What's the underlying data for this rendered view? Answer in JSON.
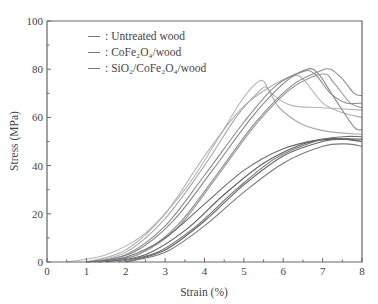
{
  "chart_data": {
    "type": "line",
    "title": "",
    "xlabel": "Strain (%)",
    "ylabel": "Stress (MPa)",
    "xlim": [
      0,
      8
    ],
    "ylim": [
      0,
      100
    ],
    "x_ticks": [
      "0",
      "1",
      "2",
      "3",
      "4",
      "5",
      "6",
      "7",
      "8"
    ],
    "y_ticks": [
      "0",
      "20",
      "40",
      "60",
      "80",
      "100"
    ],
    "grid": false,
    "legend_position": "upper-left",
    "legend": [
      {
        "name": "Untreated wood",
        "color": "#9a9a9a"
      },
      {
        "name": "CoFe2O4/wood",
        "color": "#777777"
      },
      {
        "name": "SiO2/CoFe2O4/wood",
        "color": "#555555"
      }
    ],
    "series": [
      {
        "name": "Untreated wood",
        "color": "#b5b5b5",
        "points": [
          [
            0.5,
            0
          ],
          [
            1.5,
            3
          ],
          [
            2.5,
            12
          ],
          [
            3.5,
            30
          ],
          [
            4.3,
            50
          ],
          [
            4.9,
            66
          ],
          [
            5.3,
            74
          ],
          [
            5.5,
            75
          ],
          [
            5.7,
            70
          ],
          [
            6.2,
            65
          ],
          [
            7,
            64
          ],
          [
            8,
            63
          ]
        ]
      },
      {
        "name": "Untreated wood",
        "color": "#aaaaaa",
        "points": [
          [
            1,
            0
          ],
          [
            2,
            4
          ],
          [
            3,
            18
          ],
          [
            4,
            40
          ],
          [
            4.8,
            60
          ],
          [
            5.4,
            71
          ],
          [
            5.6,
            72
          ],
          [
            5.9,
            64
          ],
          [
            6.5,
            57
          ],
          [
            7.2,
            54
          ],
          [
            8,
            53
          ]
        ]
      },
      {
        "name": "Untreated wood",
        "color": "#b0b0b0",
        "points": [
          [
            1,
            0
          ],
          [
            2,
            5
          ],
          [
            3,
            20
          ],
          [
            4,
            44
          ],
          [
            4.9,
            63
          ],
          [
            5.6,
            72
          ],
          [
            6.2,
            77
          ],
          [
            6.5,
            76
          ],
          [
            7,
            66
          ],
          [
            7.5,
            62
          ],
          [
            8,
            60
          ]
        ]
      },
      {
        "name": "CoFe2O4/wood",
        "color": "#8c8c8c",
        "points": [
          [
            1,
            0
          ],
          [
            2,
            3
          ],
          [
            3,
            15
          ],
          [
            4,
            36
          ],
          [
            5,
            58
          ],
          [
            5.8,
            73
          ],
          [
            6.5,
            79
          ],
          [
            6.8,
            78
          ],
          [
            7.2,
            70
          ],
          [
            7.6,
            66
          ],
          [
            8,
            66
          ]
        ]
      },
      {
        "name": "CoFe2O4/wood",
        "color": "#888888",
        "points": [
          [
            1.2,
            0
          ],
          [
            2.2,
            4
          ],
          [
            3.2,
            17
          ],
          [
            4.2,
            38
          ],
          [
            5.2,
            60
          ],
          [
            6,
            74
          ],
          [
            6.6,
            80
          ],
          [
            6.9,
            78
          ],
          [
            7.3,
            68
          ],
          [
            7.8,
            56
          ],
          [
            8,
            55
          ]
        ]
      },
      {
        "name": "CoFe2O4/wood",
        "color": "#909090",
        "points": [
          [
            1.3,
            0
          ],
          [
            2.3,
            3
          ],
          [
            3.3,
            15
          ],
          [
            4.3,
            36
          ],
          [
            5.3,
            58
          ],
          [
            6.2,
            73
          ],
          [
            6.9,
            79
          ],
          [
            7.2,
            80
          ],
          [
            7.5,
            76
          ],
          [
            7.8,
            70
          ],
          [
            8,
            69
          ]
        ]
      },
      {
        "name": "CoFe2O4/wood",
        "color": "#999999",
        "points": [
          [
            1.3,
            0
          ],
          [
            2.3,
            3
          ],
          [
            3.3,
            14
          ],
          [
            4.3,
            35
          ],
          [
            5.3,
            57
          ],
          [
            6.2,
            72
          ],
          [
            7,
            78
          ],
          [
            7.3,
            74
          ],
          [
            7.7,
            66
          ],
          [
            8,
            64
          ]
        ]
      },
      {
        "name": "SiO2/CoFe2O4/wood",
        "color": "#6a6a6a",
        "points": [
          [
            1,
            0
          ],
          [
            2,
            2
          ],
          [
            3,
            10
          ],
          [
            4,
            24
          ],
          [
            5,
            38
          ],
          [
            6,
            47
          ],
          [
            7,
            51
          ],
          [
            7.5,
            51
          ],
          [
            8,
            50
          ]
        ]
      },
      {
        "name": "SiO2/CoFe2O4/wood",
        "color": "#5e5e5e",
        "points": [
          [
            1.5,
            0
          ],
          [
            2.5,
            3
          ],
          [
            3.5,
            13
          ],
          [
            4.5,
            28
          ],
          [
            5.5,
            41
          ],
          [
            6.5,
            49
          ],
          [
            7.2,
            51
          ],
          [
            8,
            51
          ]
        ]
      },
      {
        "name": "SiO2/CoFe2O4/wood",
        "color": "#707070",
        "points": [
          [
            1.8,
            0
          ],
          [
            2.8,
            4
          ],
          [
            3.8,
            15
          ],
          [
            4.8,
            30
          ],
          [
            5.8,
            43
          ],
          [
            6.8,
            50
          ],
          [
            7.5,
            52
          ],
          [
            8,
            52
          ]
        ]
      },
      {
        "name": "SiO2/CoFe2O4/wood",
        "color": "#646464",
        "points": [
          [
            2,
            0
          ],
          [
            3,
            5
          ],
          [
            4,
            17
          ],
          [
            5,
            32
          ],
          [
            6,
            44
          ],
          [
            7,
            50
          ],
          [
            7.6,
            51
          ],
          [
            8,
            50
          ]
        ]
      },
      {
        "name": "SiO2/CoFe2O4/wood",
        "color": "#7a7a7a",
        "points": [
          [
            2,
            0
          ],
          [
            3,
            4
          ],
          [
            4,
            15
          ],
          [
            5,
            29
          ],
          [
            6,
            41
          ],
          [
            7,
            48
          ],
          [
            7.6,
            49
          ],
          [
            8,
            48
          ]
        ]
      }
    ]
  },
  "legend": {
    "items": [
      {
        "sep": ":",
        "label": "Untreated wood"
      },
      {
        "sep": ":",
        "label": "CoFe₂O₄/wood"
      },
      {
        "sep": ":",
        "label": "SiO₂/CoFe₂O₄/wood"
      }
    ]
  },
  "axes": {
    "xlabel": "Strain (%)",
    "ylabel": "Stress (MPa)"
  }
}
